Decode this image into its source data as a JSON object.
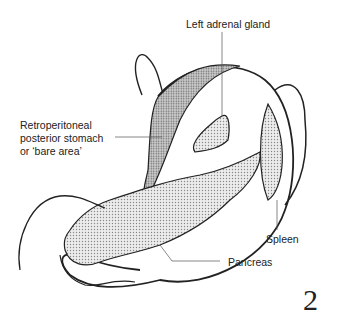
{
  "diagram": {
    "figure_number": "2",
    "labels": {
      "left_adrenal_gland": "Left adrenal gland",
      "retroperitoneal_line1": "Retroperitoneal",
      "retroperitoneal_line2": "posterior stomach",
      "retroperitoneal_line3": "or ‘bare area’",
      "spleen": "Spleen",
      "pancreas": "Pancreas"
    },
    "colors": {
      "outline": "#222222",
      "stipple_light": "#d9d9d9",
      "stipple_dark": "#b5b5b5"
    }
  }
}
